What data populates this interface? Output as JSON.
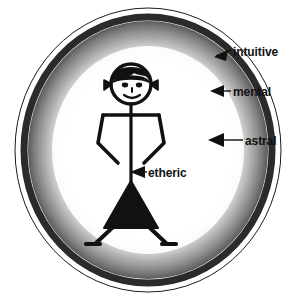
{
  "diagram": {
    "figure": "stick-figure-female",
    "background_color": "#ffffff",
    "ink_color": "#111111",
    "ring_color": "#2b2b2b",
    "glow_color": "#b9b9b9",
    "labels": [
      {
        "id": "intuitive",
        "text": "intuitive",
        "points_to": "outer-ring-edge"
      },
      {
        "id": "mental",
        "text": "mental",
        "points_to": "dark-ring-band"
      },
      {
        "id": "astral",
        "text": "astral",
        "points_to": "inner-glow-band"
      },
      {
        "id": "etheric",
        "text": "etheric",
        "points_to": "body-center-line"
      }
    ]
  }
}
